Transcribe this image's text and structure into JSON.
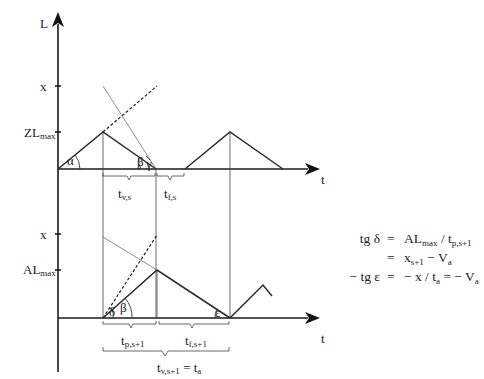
{
  "axes": {
    "y_label": "L",
    "x_label_top": "t",
    "x_label_bottom": "t"
  },
  "top_chart": {
    "tick_x": "x",
    "tick_zlmax_main": "ZL",
    "tick_zlmax_sub": "max",
    "angle_alpha": "α",
    "angle_beta": "β",
    "angle_gamma": "γ",
    "brace_tv_main": "t",
    "brace_tv_sub": "v,s",
    "brace_tf_main": "t",
    "brace_tf_sub": "f,s"
  },
  "bottom_chart": {
    "tick_x": "x",
    "tick_almax_main": "AL",
    "tick_almax_sub": "max",
    "angle_delta": "δ",
    "angle_beta": "β",
    "angle_epsilon": "ε",
    "brace_tp_main": "t",
    "brace_tp_sub": "p,s+1",
    "brace_tf_main": "t",
    "brace_tf_sub": "f,s+1",
    "brace_total_main": "t",
    "brace_total_sub": "v,s+1",
    "brace_total_eq": " = t",
    "brace_total_eq_sub": "a"
  },
  "equations": [
    {
      "lhs": "tg δ",
      "eq": "=",
      "rhs_parts": [
        {
          "text": "AL",
          "sub": "max"
        },
        {
          "text": " / t",
          "sub": "p,s+1"
        }
      ]
    },
    {
      "lhs": "",
      "eq": "=",
      "rhs_parts": [
        {
          "text": "x",
          "sub": "s+1"
        },
        {
          "text": " − V",
          "sub": "a"
        }
      ]
    },
    {
      "lhs": "− tg ε",
      "eq": "=",
      "rhs_parts": [
        {
          "text": "− x / t",
          "sub": "a"
        },
        {
          "text": " = − V",
          "sub": "a"
        }
      ]
    }
  ]
}
